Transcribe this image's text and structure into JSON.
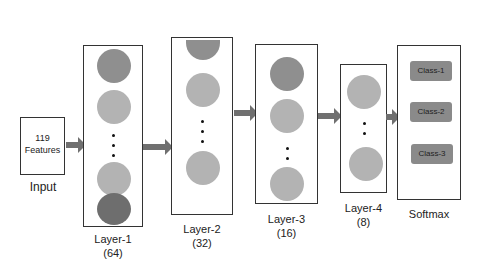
{
  "input": {
    "text_line1": "119",
    "text_line2": "Features",
    "label": "Input"
  },
  "layers": [
    {
      "name": "Layer-1",
      "units": "(64)"
    },
    {
      "name": "Layer-2",
      "units": "(32)"
    },
    {
      "name": "Layer-3",
      "units": "(16)"
    },
    {
      "name": "Layer-4",
      "units": "(8)"
    }
  ],
  "softmax": {
    "label": "Softmax",
    "classes": [
      "Class-1",
      "Class-2",
      "Class-3"
    ]
  },
  "colors": {
    "neuron_light": "#b3b3b3",
    "neuron_mid": "#9a9a9a",
    "neuron_dark": "#6e6e6e",
    "arrow": "#707070",
    "class_box": "#8a8a8a"
  }
}
